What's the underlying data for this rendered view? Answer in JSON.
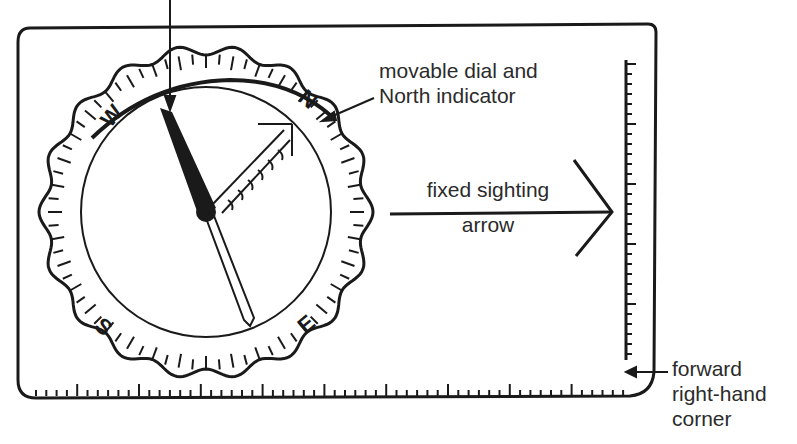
{
  "diagram": {
    "labels": {
      "dial_line1": "movable dial and",
      "dial_line2": "North indicator",
      "sighting_line1": "fixed sighting",
      "sighting_line2": "arrow",
      "corner_line1": "forward",
      "corner_line2": "right-hand",
      "corner_line3": "corner"
    },
    "cardinal_points": {
      "north": "N",
      "east": "E",
      "south": "S",
      "west": "W"
    },
    "colors": {
      "ink": "#1a1a1a",
      "background": "#ffffff"
    }
  }
}
